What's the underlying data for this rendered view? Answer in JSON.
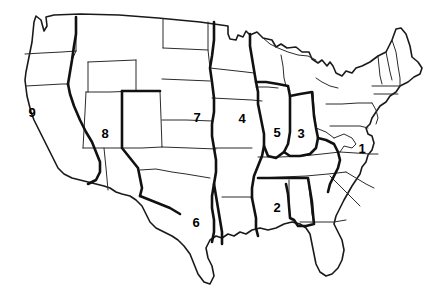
{
  "figure": {
    "name": "united-states-region-map",
    "width": 441,
    "height": 289,
    "background_color": "#ffffff",
    "line_color": "#2b2b2b",
    "region_boundary_color": "#111111",
    "label_color": "#000000"
  },
  "map": {
    "type": "outline-map",
    "projection_note": "contiguous United States, state outlines",
    "state_border_style": "thin",
    "region_border_style": "thick"
  },
  "regions": [
    {
      "id": "region-1",
      "label": "1",
      "x": 362,
      "y": 148,
      "area": "mid-atlantic"
    },
    {
      "id": "region-2",
      "label": "2",
      "x": 277,
      "y": 207,
      "area": "deep-south"
    },
    {
      "id": "region-3",
      "label": "3",
      "x": 301,
      "y": 133,
      "area": "eastern-midwest"
    },
    {
      "id": "region-4",
      "label": "4",
      "x": 242,
      "y": 118,
      "area": "upper-midwest"
    },
    {
      "id": "region-5",
      "label": "5",
      "x": 277,
      "y": 132,
      "area": "central-midwest"
    },
    {
      "id": "region-6",
      "label": "6",
      "x": 196,
      "y": 222,
      "area": "south-central"
    },
    {
      "id": "region-7",
      "label": "7",
      "x": 197,
      "y": 117,
      "area": "great-plains"
    },
    {
      "id": "region-8",
      "label": "8",
      "x": 105,
      "y": 133,
      "area": "mountain-west"
    },
    {
      "id": "region-9",
      "label": "9",
      "x": 32,
      "y": 112,
      "area": "pacific-west"
    }
  ]
}
